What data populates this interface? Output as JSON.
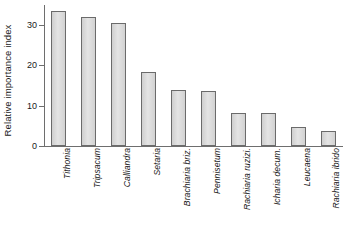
{
  "chart_data": {
    "type": "bar",
    "title": "",
    "xlabel": "",
    "ylabel": "Relative importance index",
    "ylim": [
      0,
      35
    ],
    "yticks": [
      0,
      10,
      20,
      30
    ],
    "grid": false,
    "legend": false,
    "bar_style": "filled light gray with dark gray outline",
    "categories": [
      "Tithonia",
      "Tripsacum",
      "Calliandra",
      "Setaria",
      "Brachiaria briz.",
      "Pennisetum",
      "Rachiaria ruzizi.",
      "Icharia decum.",
      "Leucaena",
      "Rachiaria ibrido"
    ],
    "values": [
      33.5,
      32.0,
      30.5,
      18.3,
      14.0,
      13.6,
      8.2,
      8.1,
      4.7,
      3.8
    ],
    "tick_labels": [
      "0",
      "10",
      "20",
      "30"
    ]
  },
  "axis": {
    "y_title": "Relative importance index"
  }
}
